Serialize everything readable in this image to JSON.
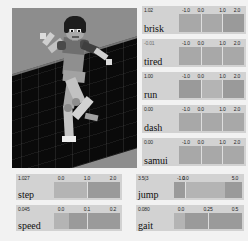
{
  "viewport": {
    "name": "character-viewport",
    "description": "3D rendered humanoid figure running on a dark gridded ground plane",
    "background_color": "#8d8d8d",
    "ground_color": "#0a0a0a"
  },
  "colors": {
    "panel": "#d2d2d2",
    "track": "#9a9a9a",
    "fill": "#a8a8a8",
    "fill_active": "#b4b4b4",
    "tick": "#e8e8e8",
    "text": "#101010"
  },
  "sliders": [
    {
      "name": "brisk",
      "value": "1.02",
      "value_num": 1.02,
      "min": -1.0,
      "max": 2.0,
      "ticks": [
        "-1.0",
        "0.0",
        "1.0",
        "2.0"
      ],
      "tick_values": [
        -1.0,
        0.0,
        1.0,
        2.0
      ],
      "fill_start": -1.0,
      "fill_end": 1.02,
      "active": false,
      "group": "right-column"
    },
    {
      "name": "tired",
      "value": "-0.01",
      "value_num": -0.01,
      "min": -1.0,
      "max": 2.0,
      "ticks": [
        "-1.0",
        "0.0",
        "1.0",
        "2.0"
      ],
      "tick_values": [
        -1.0,
        0.0,
        1.0,
        2.0
      ],
      "fill_start": -1.0,
      "fill_end": 2.0,
      "active": false,
      "group": "right-column"
    },
    {
      "name": "run",
      "value": "1.00",
      "value_num": 1.0,
      "min": -1.0,
      "max": 2.0,
      "ticks": [
        "-1.0",
        "0.0",
        "1.0",
        "2.0"
      ],
      "tick_values": [
        -1.0,
        0.0,
        1.0,
        2.0
      ],
      "fill_start": 0.0,
      "fill_end": 1.0,
      "active": true,
      "group": "right-column"
    },
    {
      "name": "dash",
      "value": "0.00",
      "value_num": 0.0,
      "min": -1.0,
      "max": 2.0,
      "ticks": [
        "-1.0",
        "0.0",
        "1.0",
        "2.0"
      ],
      "tick_values": [
        -1.0,
        0.0,
        1.0,
        2.0
      ],
      "fill_start": -1.0,
      "fill_end": 2.0,
      "active": false,
      "group": "right-column"
    },
    {
      "name": "samui",
      "value": "0.00",
      "value_num": 0.0,
      "min": -1.0,
      "max": 2.0,
      "ticks": [
        "-1.0",
        "0.0",
        "1.0",
        "2.0"
      ],
      "tick_values": [
        -1.0,
        0.0,
        1.0,
        2.0
      ],
      "fill_start": -1.0,
      "fill_end": 2.0,
      "active": false,
      "group": "right-column"
    },
    {
      "name": "step",
      "value": "1.027",
      "value_num": 1.027,
      "min": 0.0,
      "max": 2.0,
      "ticks": [
        "0.0",
        "1.0",
        "2.0"
      ],
      "tick_values": [
        0.0,
        1.0,
        2.0
      ],
      "fill_start": 0.0,
      "fill_end": 1.027,
      "active": true,
      "group": "bottom-left"
    },
    {
      "name": "speed",
      "value": "0.045",
      "value_num": 0.045,
      "min": 0.0,
      "max": 0.2,
      "ticks": [
        "0.0",
        "0.1",
        "0.2"
      ],
      "tick_values": [
        0.0,
        0.1,
        0.2
      ],
      "fill_start": 0.0,
      "fill_end": 0.045,
      "active": true,
      "group": "bottom-left"
    },
    {
      "name": "jump",
      "value": "3.5(3",
      "value_num": 3.5,
      "min": -1.0,
      "max": 5.0,
      "ticks": [
        "-1.0",
        "0.0",
        "5.0"
      ],
      "tick_values": [
        -1.0,
        0.0,
        5.0
      ],
      "fill_start": 0.0,
      "fill_end": 3.5,
      "active": true,
      "group": "bottom-right"
    },
    {
      "name": "gait",
      "value": "0.080",
      "value_num": 0.08,
      "min": 0.0,
      "max": 0.5,
      "ticks": [
        "0.0",
        "0.25",
        "0.5"
      ],
      "tick_values": [
        0.0,
        0.25,
        0.5
      ],
      "fill_start": 0.0,
      "fill_end": 0.08,
      "active": true,
      "group": "bottom-right"
    }
  ],
  "layout": {
    "right_column": {
      "x": 142,
      "y": 6,
      "w": 104,
      "h": 28,
      "gap": 33
    },
    "bottom_left": {
      "x": 16,
      "y": 174,
      "w": 106,
      "h": 26,
      "gap": 31
    },
    "bottom_right": {
      "x": 136,
      "y": 174,
      "w": 108,
      "h": 26,
      "gap": 31
    }
  }
}
